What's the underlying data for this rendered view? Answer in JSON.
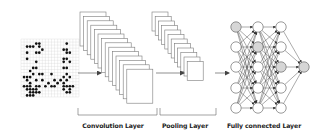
{
  "diagram": {
    "type": "CNN architecture",
    "input": {
      "kind": "go-board",
      "grid_size": 19,
      "stones": [
        [
          2,
          3
        ],
        [
          3,
          3
        ],
        [
          4,
          3
        ],
        [
          5,
          2
        ],
        [
          6,
          2
        ],
        [
          6,
          3
        ],
        [
          7,
          4
        ],
        [
          2,
          5
        ],
        [
          5,
          5
        ],
        [
          6,
          5
        ],
        [
          15,
          2
        ],
        [
          14,
          4
        ],
        [
          15,
          4
        ],
        [
          16,
          5
        ],
        [
          15,
          5
        ],
        [
          2,
          7
        ],
        [
          5,
          8
        ],
        [
          14,
          7
        ],
        [
          15,
          7
        ],
        [
          16,
          8
        ],
        [
          14,
          8
        ],
        [
          4,
          10
        ],
        [
          5,
          10
        ],
        [
          14,
          10
        ],
        [
          15,
          10
        ],
        [
          3,
          11
        ],
        [
          15,
          12
        ],
        [
          1,
          13
        ],
        [
          2,
          13
        ],
        [
          3,
          13
        ],
        [
          4,
          12
        ],
        [
          6,
          12
        ],
        [
          7,
          12
        ],
        [
          10,
          12
        ],
        [
          14,
          13
        ],
        [
          16,
          13
        ],
        [
          2,
          14
        ],
        [
          3,
          15
        ],
        [
          5,
          14
        ],
        [
          7,
          14
        ],
        [
          9,
          15
        ],
        [
          11,
          14
        ],
        [
          12,
          15
        ],
        [
          13,
          14
        ],
        [
          14,
          15
        ],
        [
          15,
          14
        ],
        [
          1,
          16
        ],
        [
          2,
          16
        ],
        [
          3,
          16
        ],
        [
          4,
          17
        ],
        [
          5,
          16
        ],
        [
          6,
          16
        ],
        [
          8,
          16
        ],
        [
          10,
          16
        ],
        [
          11,
          16
        ],
        [
          14,
          16
        ],
        [
          15,
          16
        ],
        [
          16,
          16
        ],
        [
          17,
          16
        ],
        [
          2,
          17
        ],
        [
          3,
          17
        ],
        [
          5,
          17
        ],
        [
          14,
          17
        ],
        [
          16,
          17
        ],
        [
          3,
          18
        ],
        [
          4,
          18
        ],
        [
          5,
          18
        ],
        [
          6,
          18
        ],
        [
          15,
          18
        ],
        [
          16,
          18
        ],
        [
          2,
          19
        ],
        [
          3,
          19
        ],
        [
          4,
          19
        ]
      ]
    },
    "layers": [
      {
        "name": "Convolution Layer",
        "type": "convolution",
        "maps": 14
      },
      {
        "name": "Pooling Layer",
        "type": "pooling",
        "maps": 12
      },
      {
        "name": "Fully connected Layer",
        "type": "fully-connected",
        "columns": [
          5,
          5,
          5,
          1
        ],
        "highlighted": [
          [
            0,
            0
          ],
          [
            1,
            1
          ],
          [
            2,
            2
          ],
          [
            3,
            0
          ]
        ]
      }
    ],
    "labels": {
      "conv": "Convolution Layer",
      "pool": "Pooling Layer",
      "fc": "Fully connected Layer"
    },
    "colors": {
      "stroke": "#555555",
      "card_stroke": "#7a7a7a",
      "stone": "#111111",
      "node_fill": "#ffffff",
      "node_highlight": "#d6d6d6",
      "grid": "#cfcfcf"
    }
  }
}
